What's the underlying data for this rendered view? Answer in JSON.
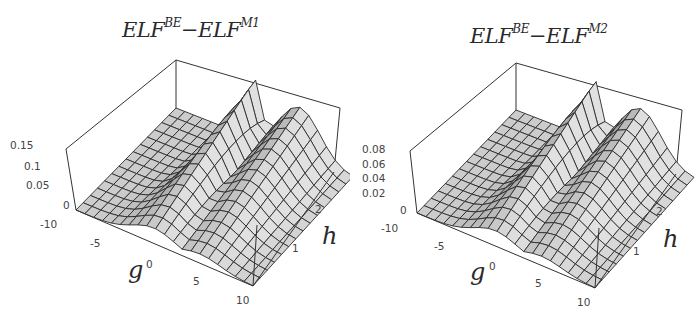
{
  "chart_data": [
    {
      "type": "surface3d",
      "title": "ELF^BE - ELF^M1",
      "title_parts": {
        "base1": "ELF",
        "sup1": "BE",
        "minus": "−",
        "base2": "ELF",
        "sup2": "M1"
      },
      "xlabel": "g",
      "ylabel": "h",
      "zlabel": "",
      "x_ticks": [
        "-10",
        "-5",
        "0",
        "5",
        "10"
      ],
      "y_ticks": [
        "1",
        "2"
      ],
      "z_ticks": [
        "0",
        "0.05",
        "0.1",
        "0.15"
      ],
      "xlim": [
        -10,
        10
      ],
      "ylim": [
        0,
        3
      ],
      "zlim": [
        0,
        0.15
      ],
      "description": "Mesh surface with a sharp ridge near g=0 peaking ~0.15 at large h, falling to ~0 for g=-10; a secondary broad ridge for g>0 reaching ~0.12 at large h.",
      "grid": false
    },
    {
      "type": "surface3d",
      "title": "ELF^BE - ELF^M2",
      "title_parts": {
        "base1": "ELF",
        "sup1": "BE",
        "minus": "−",
        "base2": "ELF",
        "sup2": "M2"
      },
      "xlabel": "g",
      "ylabel": "h",
      "zlabel": "",
      "x_ticks": [
        "-10",
        "-5",
        "0",
        "5",
        "10"
      ],
      "y_ticks": [
        "1",
        "2"
      ],
      "z_ticks": [
        "0",
        "0.02",
        "0.04",
        "0.06",
        "0.08"
      ],
      "xlim": [
        -10,
        10
      ],
      "ylim": [
        0,
        3
      ],
      "zlim": [
        0,
        0.08
      ],
      "description": "Mesh surface with a sharp ridge near g=0 peaking ~0.08 at large h, a secondary broad ridge for g>0 reaching ~0.065.",
      "grid": false
    }
  ],
  "colors": {
    "background": "#ffffff",
    "box": "#333333",
    "mesh": "#2b2b2b",
    "surface_light": "#d4d4d4",
    "surface_mid": "#b8b8b8",
    "surface_dark": "#8e8e8e",
    "text": "#444444"
  }
}
